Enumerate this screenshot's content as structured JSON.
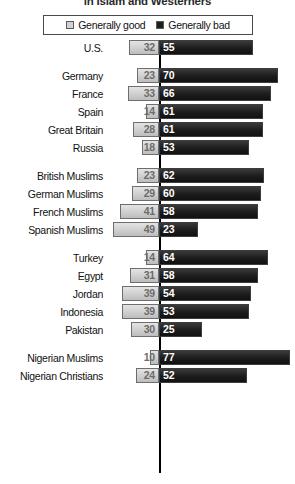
{
  "chart": {
    "title": "in Islam and Westerners",
    "legend": {
      "position": "top-center",
      "entries": [
        {
          "label": "Generally good",
          "swatch": "light-square",
          "color": "#d2d2d2"
        },
        {
          "label": "Generally bad",
          "swatch": "dark-square",
          "color": "#1e1e1e"
        }
      ]
    }
  },
  "chart_data": {
    "type": "bar",
    "orientation": "horizontal-diverging",
    "title": "in Islam and Westerners",
    "xlabel": "",
    "ylabel": "",
    "grid": false,
    "legend_position": "top-center",
    "axis_center": 0,
    "xlim": [
      0,
      80
    ],
    "series": [
      {
        "name": "Generally good",
        "color": "#d2d2d2",
        "direction": "left"
      },
      {
        "name": "Generally bad",
        "color": "#1e1e1e",
        "direction": "right"
      }
    ],
    "groups": [
      {
        "name": "United States",
        "categories": [
          "U.S."
        ],
        "rows": [
          {
            "label": "U.S.",
            "good": 32,
            "bad": 55
          }
        ]
      },
      {
        "name": "Europe and Russia",
        "categories": [
          "Germany",
          "France",
          "Spain",
          "Great Britain",
          "Russia"
        ],
        "rows": [
          {
            "label": "Germany",
            "good": 23,
            "bad": 70
          },
          {
            "label": "France",
            "good": 33,
            "bad": 66
          },
          {
            "label": "Spain",
            "good": 14,
            "bad": 61
          },
          {
            "label": "Great Britain",
            "good": 28,
            "bad": 61
          },
          {
            "label": "Russia",
            "good": 18,
            "bad": 53
          }
        ]
      },
      {
        "name": "Muslim minorities in Europe",
        "categories": [
          "British Muslims",
          "German Muslims",
          "French Muslims",
          "Spanish Muslims"
        ],
        "rows": [
          {
            "label": "British Muslims",
            "good": 23,
            "bad": 62
          },
          {
            "label": "German Muslims",
            "good": 29,
            "bad": 60
          },
          {
            "label": "French Muslims",
            "good": 41,
            "bad": 58
          },
          {
            "label": "Spanish Muslims",
            "good": 49,
            "bad": 23
          }
        ]
      },
      {
        "name": "Muslim publics",
        "categories": [
          "Turkey",
          "Egypt",
          "Jordan",
          "Indonesia",
          "Pakistan"
        ],
        "rows": [
          {
            "label": "Turkey",
            "good": 14,
            "bad": 64
          },
          {
            "label": "Egypt",
            "good": 31,
            "bad": 58
          },
          {
            "label": "Jordan",
            "good": 39,
            "bad": 54
          },
          {
            "label": "Indonesia",
            "good": 39,
            "bad": 53
          },
          {
            "label": "Pakistan",
            "good": 30,
            "bad": 25
          }
        ]
      },
      {
        "name": "Nigeria",
        "categories": [
          "Nigerian Muslims",
          "Nigerian Christians"
        ],
        "rows": [
          {
            "label": "Nigerian Muslims",
            "good": 10,
            "bad": 77
          },
          {
            "label": "Nigerian Christians",
            "good": 24,
            "bad": 52
          }
        ]
      }
    ]
  }
}
